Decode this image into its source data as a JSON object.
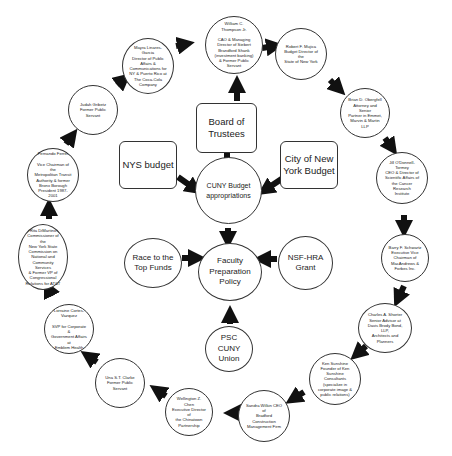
{
  "center": {
    "board": "Board of Trustees",
    "nys_budget": "NYS budget",
    "city_budget": "City of New York Budget",
    "cuny_budget": "CUNY Budget appropriations",
    "faculty_policy": "Faculty Preparation Policy",
    "race_to_top": "Race to the Top Funds",
    "nsf_hra": "NSF-HRA Grant",
    "psc_cuny": "PSC CUNY Union"
  },
  "ring": [
    {
      "id": "thompson",
      "lines": [
        "William C.",
        "Thompson Jr.",
        "",
        "CAO & Managing",
        "Director of Siebert",
        "Brandford Shank",
        "(investment banking)",
        "& Former Public",
        "Servant"
      ]
    },
    {
      "id": "mujica",
      "lines": [
        "Robert F. Mujica",
        "Budget Director of the",
        "State of New York"
      ]
    },
    {
      "id": "obeng",
      "lines": [
        "Brian D. Obergfell",
        "Attorney and Senior",
        "Partner in Emmet,",
        "Marvin & Martin LLP"
      ]
    },
    {
      "id": "farmey",
      "lines": [
        "Jill O'Donnell-Tormey",
        "CEO & Director of",
        "Scientific Affairs of",
        "the Cancer Research",
        "Institute"
      ]
    },
    {
      "id": "schwartz",
      "lines": [
        "Barry F. Schwartz",
        "Executive Vice",
        "Chairman of",
        "MacAndrews &",
        "Forbes Inc."
      ]
    },
    {
      "id": "shorter",
      "lines": [
        "Charles A. Shorter",
        "Senior Advisor at",
        "Davis Brody Bond, LLP,",
        "Architects and",
        "Planners"
      ]
    },
    {
      "id": "sunshine",
      "lines": [
        "Ken Sunshine",
        "Founder of Ken",
        "Sunshine Consultants",
        "(specialize in",
        "corporate image &",
        "public relations)"
      ]
    },
    {
      "id": "wilkins",
      "lines": [
        "Sandra Wilkin CEO of",
        "Bradford Construction",
        "Management Firm"
      ]
    },
    {
      "id": "chen",
      "lines": [
        "Wellington Z. Chen",
        "Executive Director of",
        "the Chinatown",
        "Partnership"
      ]
    },
    {
      "id": "clarke",
      "lines": [
        "Una S.T. Clarke",
        "Former Public Servant"
      ]
    },
    {
      "id": "vazquez",
      "lines": [
        "Lorraine Cortes-",
        "Vazquez",
        "",
        "SVP for Corporate &",
        "Government Affairs at",
        "Emblem Health"
      ]
    },
    {
      "id": "dimartino",
      "lines": [
        "Rita DiMartino",
        "Commissioner of the",
        "New York State",
        "Commission on",
        "National and",
        "Community Services",
        "& Former VP of",
        "Congressional",
        "Relations for AT&T"
      ]
    },
    {
      "id": "ferrer",
      "lines": [
        "Fernando Ferrer",
        "",
        "Vice Chairman of the",
        "Metropolitan Transit",
        "Authority & former",
        "Bronx Borough",
        "President 1987-2001"
      ]
    },
    {
      "id": "oriz",
      "lines": [
        "Judah Gribetz",
        "Former Public Servant"
      ]
    },
    {
      "id": "garcia",
      "lines": [
        "Mayra Linares-Garcia",
        "Director of Public",
        "Affairs &",
        "Communications for",
        "NY & Puerto Rico at",
        "The Coca-Cola",
        "Company"
      ]
    }
  ],
  "colors": {
    "stroke": "#333333",
    "arrow": "#111111",
    "background": "#ffffff"
  }
}
